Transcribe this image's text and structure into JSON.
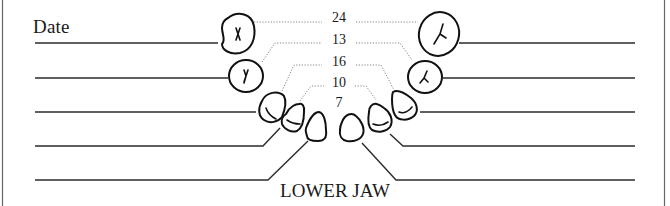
{
  "chart": {
    "date_label": "Date",
    "title": "LOWER JAW",
    "colors": {
      "ink": "#1a1a1a",
      "dotted": "#777777",
      "border": "#555555",
      "background": "#ffffff"
    },
    "eruption_ages": [
      {
        "value": "24",
        "teeth": "second molars"
      },
      {
        "value": "13",
        "teeth": "first molars"
      },
      {
        "value": "16",
        "teeth": "canines"
      },
      {
        "value": "10",
        "teeth": "lateral incisors"
      },
      {
        "value": "7",
        "teeth": "central incisors"
      }
    ],
    "left_lines_count": 5,
    "right_lines_count": 5
  }
}
